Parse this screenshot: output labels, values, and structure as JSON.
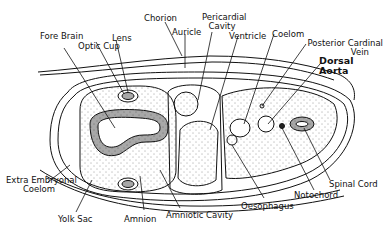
{
  "diagram": {
    "labels": {
      "chorion": "Chorion",
      "auricle": "Auricle",
      "pericardial_cavity_1": "Pericardial",
      "pericardial_cavity_2": "Cavity",
      "ventricle": "Ventricle",
      "coelom": "Coelom",
      "posterior_cardinal_vein_1": "Posterior Cardinal",
      "posterior_cardinal_vein_2": "Vein",
      "dorsal_aorta_1": "Dorsal",
      "dorsal_aorta_2": "Aorta",
      "fore_brain": "Fore Brain",
      "lens": "Lens",
      "optic_cup": "Optic Cup",
      "extra_embryonal_coelom_1": "Extra Embryonal",
      "extra_embryonal_coelom_2": "Coelom",
      "yolk_sac": "Yolk Sac",
      "amnion": "Amnion",
      "amniotic_cavity": "Amniotic Cavity",
      "oesophagus": "Oesophagus",
      "notochord": "Notochord",
      "spinal_cord": "Spinal Cord"
    }
  }
}
